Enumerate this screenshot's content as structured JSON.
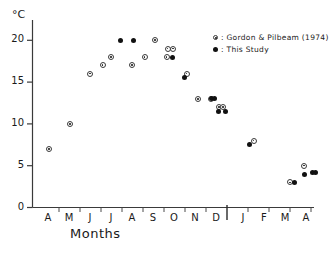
{
  "chart_data": {
    "type": "scatter",
    "title": "",
    "xlabel": "Months",
    "ylabel": "°C",
    "ylim": [
      0,
      21.5
    ],
    "yticks": [
      0,
      5,
      10,
      15,
      20
    ],
    "ytick_labels": [
      "0",
      "5",
      "10",
      "15",
      "20"
    ],
    "categories": [
      "A",
      "M",
      "J",
      "J",
      "A",
      "S",
      "O",
      "N",
      "D",
      "J",
      "F",
      "M",
      "A"
    ],
    "xtick_labels": [
      "A",
      "M",
      "J",
      "J",
      "A",
      "S",
      "O",
      "N",
      "D",
      "J",
      "F",
      "M",
      "A"
    ],
    "x_separator_after": "D",
    "grid": false,
    "legend_position": "top-right",
    "series": [
      {
        "name": "Gordon & Pilbeam (1974)",
        "marker": "open-circle-dot",
        "color": "#222222",
        "points": [
          {
            "x": "A",
            "x_frac": 0.05,
            "y": 7
          },
          {
            "x": "M",
            "x_frac": 1.05,
            "y": 10
          },
          {
            "x": "J",
            "x_frac": 2.0,
            "y": 16
          },
          {
            "x": "J",
            "x_frac": 2.6,
            "y": 17
          },
          {
            "x": "J",
            "x_frac": 3.0,
            "y": 18
          },
          {
            "x": "A",
            "x_frac": 4.0,
            "y": 17
          },
          {
            "x": "A",
            "x_frac": 4.6,
            "y": 18
          },
          {
            "x": "S",
            "x_frac": 5.1,
            "y": 20
          },
          {
            "x": "S",
            "x_frac": 5.7,
            "y": 19
          },
          {
            "x": "S",
            "x_frac": 5.95,
            "y": 19
          },
          {
            "x": "S",
            "x_frac": 5.65,
            "y": 18
          },
          {
            "x": "O",
            "x_frac": 6.6,
            "y": 16
          },
          {
            "x": "O",
            "x_frac": 7.15,
            "y": 13
          },
          {
            "x": "N",
            "x_frac": 7.75,
            "y": 13
          },
          {
            "x": "N",
            "x_frac": 8.15,
            "y": 12
          },
          {
            "x": "N",
            "x_frac": 8.35,
            "y": 12
          },
          {
            "x": "D",
            "x_frac": 9.5,
            "y": 8
          },
          {
            "x": "M",
            "x_frac": 11.25,
            "y": 3
          },
          {
            "x": "M",
            "x_frac": 11.9,
            "y": 5
          }
        ]
      },
      {
        "name": "This Study",
        "marker": "filled-circle",
        "color": "#111111",
        "points": [
          {
            "x": "J",
            "x_frac": 3.45,
            "y": 20
          },
          {
            "x": "A",
            "x_frac": 4.05,
            "y": 20
          },
          {
            "x": "S",
            "x_frac": 5.95,
            "y": 18
          },
          {
            "x": "O",
            "x_frac": 6.5,
            "y": 15.5
          },
          {
            "x": "N",
            "x_frac": 7.8,
            "y": 13
          },
          {
            "x": "N",
            "x_frac": 7.95,
            "y": 13
          },
          {
            "x": "N",
            "x_frac": 8.1,
            "y": 11.5
          },
          {
            "x": "N",
            "x_frac": 8.45,
            "y": 11.5
          },
          {
            "x": "D",
            "x_frac": 9.3,
            "y": 7.5
          },
          {
            "x": "M",
            "x_frac": 11.45,
            "y": 3
          },
          {
            "x": "M",
            "x_frac": 11.95,
            "y": 4
          },
          {
            "x": "A",
            "x_frac": 12.3,
            "y": 4.2
          },
          {
            "x": "A",
            "x_frac": 12.45,
            "y": 4.2
          }
        ]
      }
    ],
    "legend": [
      {
        "label": ": Gordon & Pilbeam (1974)",
        "marker": "open-circle-dot"
      },
      {
        "label": ": This  Study",
        "marker": "filled-circle"
      }
    ]
  }
}
